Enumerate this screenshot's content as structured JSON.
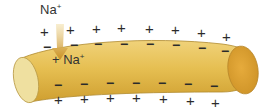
{
  "diagram": {
    "colors": {
      "axon_body": "#e2b84a",
      "axon_highlight": "#f0d27a",
      "axon_shadow": "#c99a2c",
      "left_end": "#efe0a0",
      "right_end": "#d9a23a",
      "outline": "#a9832a",
      "arrow": "#d4a23a",
      "text": "#333333"
    },
    "labels": {
      "ion_outside": {
        "base": "Na",
        "charge": "+"
      },
      "ion_inside": {
        "prefix": "+ ",
        "base": "Na",
        "charge": "+"
      }
    },
    "charges": {
      "outside_top": [
        "+",
        "+",
        "+",
        "+",
        "+",
        "+",
        "+",
        "+"
      ],
      "inside_top": [
        "−",
        "−",
        "−",
        "−",
        "−",
        "−",
        "−",
        "−"
      ],
      "inside_bottom": [
        "−",
        "−",
        "−",
        "−",
        "−",
        "−",
        "−"
      ],
      "outside_bottom": [
        "+",
        "+",
        "+",
        "+",
        "+",
        "+",
        "+"
      ]
    },
    "arrow": {
      "label": "Na+ influx",
      "direction": "down"
    }
  }
}
